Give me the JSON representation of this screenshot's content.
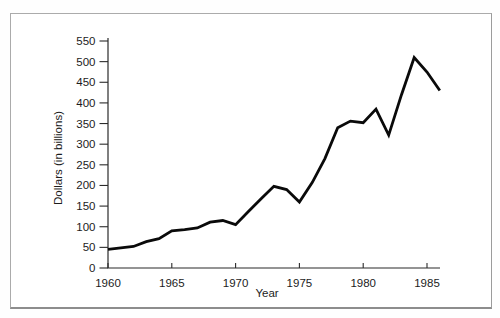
{
  "chart_data": {
    "type": "line",
    "title": "",
    "xlabel": "Year",
    "ylabel": "Dollars (in billions)",
    "xlim": [
      1960,
      1986
    ],
    "ylim": [
      0,
      550
    ],
    "grid": false,
    "legend": null,
    "xticks": [
      1960,
      1965,
      1970,
      1975,
      1980,
      1985
    ],
    "yticks": [
      0,
      50,
      100,
      150,
      200,
      250,
      300,
      350,
      400,
      450,
      500,
      550
    ],
    "line_color": "#0a0a0a",
    "axis_color": "#2b2b2b",
    "series": [
      {
        "name": "dollars-in-billions",
        "x": [
          1960,
          1961,
          1962,
          1963,
          1964,
          1965,
          1966,
          1967,
          1968,
          1969,
          1970,
          1971,
          1972,
          1973,
          1974,
          1975,
          1976,
          1977,
          1978,
          1979,
          1980,
          1981,
          1982,
          1983,
          1984,
          1985,
          1986
        ],
        "y": [
          45,
          49,
          52,
          64,
          71,
          90,
          93,
          97,
          111,
          115,
          105,
          137,
          168,
          198,
          190,
          160,
          207,
          265,
          340,
          356,
          352,
          385,
          322,
          420,
          510,
          475,
          430
        ]
      }
    ]
  }
}
